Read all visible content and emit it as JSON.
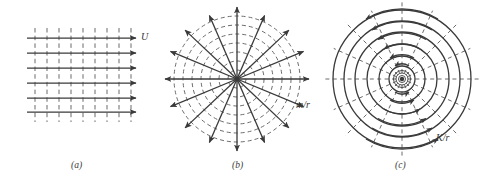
{
  "figure": {
    "type": "diagram",
    "background_color": "#ffffff",
    "stroke_color": "#3a3a3a",
    "dash_color": "#6b6b6b",
    "width": 489,
    "height": 184
  },
  "panels": [
    {
      "id": "a",
      "caption": "(a)",
      "name": "uniform-stream",
      "label": "U",
      "label_meaning": "free-stream velocity",
      "streamlines": {
        "style": "solid-horizontal-arrows",
        "count": 6,
        "direction": "left-to-right",
        "x_start": 27,
        "x_end": 138,
        "y_values": [
          38,
          53,
          68,
          83,
          98,
          112
        ]
      },
      "equipotentials": {
        "style": "dashed-vertical",
        "count": 9,
        "x_values": [
          35,
          47,
          59,
          71,
          83,
          95,
          107,
          119,
          131
        ],
        "y_top": 28,
        "y_bottom": 122
      }
    },
    {
      "id": "b",
      "caption": "(b)",
      "name": "line-source",
      "label": "m/r",
      "label_meaning": "radial velocity of a source of strength m",
      "center": {
        "x": 237,
        "y": 79
      },
      "streamlines": {
        "style": "solid-radial-arrows-outward",
        "count": 16,
        "angle_step_deg": 22.5,
        "radius": 74
      },
      "equipotentials": {
        "style": "dashed-concentric-circles",
        "count": 7,
        "radii": [
          9,
          18,
          27,
          36,
          45,
          54,
          63
        ]
      }
    },
    {
      "id": "c",
      "caption": "(c)",
      "name": "line-vortex",
      "label": "K/r",
      "label_meaning": "tangential velocity of a vortex of strength K",
      "center": {
        "x": 402,
        "y": 79
      },
      "streamlines": {
        "style": "solid-concentric-circles-with-arrows",
        "direction": "counterclockwise",
        "count": 6,
        "radii": [
          13,
          23,
          35,
          47,
          58,
          69
        ],
        "core_radii": [
          3,
          5,
          7
        ]
      },
      "equipotentials": {
        "style": "dashed-radial-spokes",
        "count": 16,
        "angle_step_deg": 22.5,
        "r_inner": 6,
        "r_outer": 80
      }
    }
  ]
}
